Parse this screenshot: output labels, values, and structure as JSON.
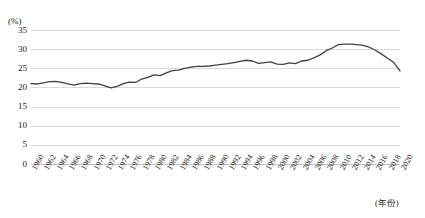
{
  "chart_data": {
    "type": "line",
    "title": "",
    "xlabel": "(年份)",
    "ylabel": "(%)",
    "ylim": [
      0,
      35
    ],
    "ytick_step": 5,
    "yticks": [
      "0",
      "5",
      "10",
      "15",
      "20",
      "25",
      "30",
      "35"
    ],
    "xlim": [
      1960,
      2020
    ],
    "xtick_step": 2,
    "grid": true,
    "legend": "none",
    "line_color": "#404040",
    "grid_color": "#d9d9d9",
    "categories": [
      "1960",
      "1961",
      "1962",
      "1963",
      "1964",
      "1965",
      "1966",
      "1967",
      "1968",
      "1969",
      "1970",
      "1971",
      "1972",
      "1973",
      "1974",
      "1975",
      "1976",
      "1977",
      "1978",
      "1979",
      "1980",
      "1981",
      "1982",
      "1983",
      "1984",
      "1985",
      "1986",
      "1987",
      "1988",
      "1989",
      "1990",
      "1991",
      "1992",
      "1993",
      "1994",
      "1995",
      "1996",
      "1997",
      "1998",
      "1999",
      "2000",
      "2001",
      "2002",
      "2003",
      "2004",
      "2005",
      "2006",
      "2007",
      "2008",
      "2009",
      "2010",
      "2011",
      "2012",
      "2013",
      "2014",
      "2015",
      "2016",
      "2017",
      "2018",
      "2019",
      "2020"
    ],
    "xtick_labels": [
      "1960",
      "1962",
      "1964",
      "1966",
      "1968",
      "1970",
      "1972",
      "1974",
      "1976",
      "1978",
      "1980",
      "1982",
      "1984",
      "1986",
      "1988",
      "1990",
      "1992",
      "1994",
      "1996",
      "1998",
      "2000",
      "2002",
      "2004",
      "2006",
      "2008",
      "2010",
      "2012",
      "2014",
      "2016",
      "2018",
      "2020"
    ],
    "values": [
      21.0,
      20.9,
      21.2,
      21.5,
      21.6,
      21.3,
      20.9,
      20.6,
      21.0,
      21.1,
      21.0,
      20.9,
      20.4,
      19.9,
      20.3,
      21.0,
      21.4,
      21.3,
      22.2,
      22.6,
      23.3,
      23.1,
      23.8,
      24.4,
      24.5,
      25.0,
      25.3,
      25.5,
      25.5,
      25.6,
      25.8,
      26.0,
      26.2,
      26.5,
      26.8,
      27.1,
      26.9,
      26.3,
      26.5,
      26.7,
      26.1,
      26.0,
      26.4,
      26.2,
      26.9,
      27.1,
      27.7,
      28.5,
      29.6,
      30.3,
      31.2,
      31.3,
      31.3,
      31.2,
      31.0,
      30.5,
      29.7,
      28.7,
      27.6,
      26.5,
      24.3
    ]
  }
}
